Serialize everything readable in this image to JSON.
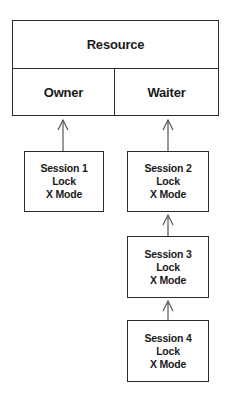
{
  "diagram": {
    "resource": {
      "title": "Resource",
      "owner_label": "Owner",
      "waiter_label": "Waiter"
    },
    "sessions": [
      {
        "name": "Session 1",
        "line2": "Lock",
        "line3": "X Mode",
        "role": "owner"
      },
      {
        "name": "Session 2",
        "line2": "Lock",
        "line3": "X Mode",
        "role": "waiter"
      },
      {
        "name": "Session 3",
        "line2": "Lock",
        "line3": "X Mode",
        "role": "waiter"
      },
      {
        "name": "Session 4",
        "line2": "Lock",
        "line3": "X Mode",
        "role": "waiter"
      }
    ],
    "edges": [
      {
        "from": "Session 1",
        "to": "Owner"
      },
      {
        "from": "Session 2",
        "to": "Waiter"
      },
      {
        "from": "Session 3",
        "to": "Session 2"
      },
      {
        "from": "Session 4",
        "to": "Session 3"
      }
    ],
    "colors": {
      "stroke": "#2b2b2b",
      "arrow": "#555555",
      "background": "#ffffff",
      "text": "#1a1a1a"
    }
  }
}
